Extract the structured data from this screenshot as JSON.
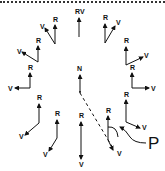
{
  "diagram": {
    "labels": {
      "top": "RV",
      "center": "N",
      "pointer": "P",
      "r": "R",
      "v": "V"
    },
    "colors": {
      "ink": "#111111",
      "background": "#ffffff"
    },
    "vector_pairs": [
      {
        "id": "top",
        "r_label": "R",
        "v_label": "V",
        "combined_label": "RV"
      },
      {
        "id": "top-right",
        "r_label": "R",
        "v_label": "V"
      },
      {
        "id": "right-upper",
        "r_label": "R",
        "v_label": "V"
      },
      {
        "id": "right",
        "r_label": "R",
        "v_label": "V"
      },
      {
        "id": "right-lower",
        "r_label": "R",
        "v_label": "V"
      },
      {
        "id": "bottom-right-p",
        "r_label": "R",
        "v_label": "V"
      },
      {
        "id": "bottom",
        "r_label": "R",
        "v_label": "V"
      },
      {
        "id": "bottom-left",
        "r_label": "R",
        "v_label": "V"
      },
      {
        "id": "left-lower",
        "r_label": "R",
        "v_label": "V"
      },
      {
        "id": "left",
        "r_label": "R",
        "v_label": "V"
      },
      {
        "id": "left-upper",
        "r_label": "R",
        "v_label": "V"
      },
      {
        "id": "top-left",
        "r_label": "R",
        "v_label": "V"
      }
    ]
  }
}
